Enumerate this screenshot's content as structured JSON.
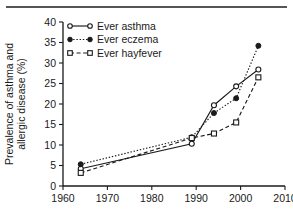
{
  "chart_data": {
    "type": "line",
    "title": "",
    "subtitle": "",
    "xlabel": "",
    "ylabel": "Prevalence of asthma and allergic disease (%)",
    "ylabel_line1": "Prevalence of asthma and",
    "ylabel_line2": "allergic disease (%)",
    "xlim": [
      1960,
      2010
    ],
    "ylim": [
      0,
      40
    ],
    "xticks": [
      1960,
      1970,
      1980,
      1990,
      2000,
      2010
    ],
    "yticks": [
      0,
      5,
      10,
      15,
      20,
      25,
      30,
      35,
      40
    ],
    "grid": false,
    "legend_position": "top-left-inside",
    "series": [
      {
        "name": "Ever asthma",
        "marker": "open-circle",
        "line_style": "solid",
        "color": "#1a1a1a",
        "x": [
          1964,
          1989,
          1994,
          1999,
          2004
        ],
        "values": [
          4.2,
          10.3,
          19.7,
          24.3,
          28.4
        ]
      },
      {
        "name": "Ever eczema",
        "marker": "filled-circle",
        "line_style": "dotted",
        "color": "#1a1a1a",
        "x": [
          1964,
          1989,
          1994,
          1999,
          2004
        ],
        "values": [
          5.3,
          11.9,
          17.8,
          21.4,
          34.2
        ]
      },
      {
        "name": "Ever hayfever",
        "marker": "open-square",
        "line_style": "dashed",
        "color": "#1a1a1a",
        "x": [
          1964,
          1989,
          1994,
          1999,
          2004
        ],
        "values": [
          3.2,
          11.7,
          12.8,
          15.5,
          26.5
        ]
      }
    ]
  },
  "axes": {
    "x_tick_labels": [
      "1960",
      "1970",
      "1980",
      "1990",
      "2000",
      "2010"
    ],
    "y_tick_labels": [
      "0",
      "5",
      "10",
      "15",
      "20",
      "25",
      "30",
      "35",
      "40"
    ]
  },
  "legend": {
    "items": [
      {
        "label": "Ever asthma"
      },
      {
        "label": "Ever eczema"
      },
      {
        "label": "Ever hayfever"
      }
    ]
  },
  "colors": {
    "ink": "#1a1a1a",
    "rule": "#555555",
    "background": "#ffffff"
  }
}
